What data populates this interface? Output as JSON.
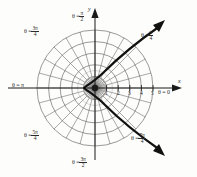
{
  "figure": {
    "background_color": "#fdfdfc",
    "grid_color": "#6f6f6f",
    "axis_color": "#1a1a1a",
    "curve_color": "#111111",
    "pole": {
      "x": 95,
      "y": 88
    },
    "unit_px": 11.6,
    "axes": {
      "x_label": "x",
      "y_label": "y"
    },
    "radial_ticks": [
      "1",
      "2",
      "3",
      "4",
      "5"
    ],
    "radial_circle_count": 5,
    "spoke_count": 24,
    "angle_labels": [
      {
        "key": "theta_pi_over_2",
        "theta": "θ =",
        "num": "π",
        "den": "2",
        "deg": 90
      },
      {
        "key": "theta_3pi_over_4",
        "theta": "θ =",
        "num": "3π",
        "den": "4",
        "deg": 135
      },
      {
        "key": "theta_pi",
        "theta": "θ =",
        "num": "π",
        "den": "",
        "deg": 180
      },
      {
        "key": "theta_5pi_over_4",
        "theta": "θ =",
        "num": "5π",
        "den": "4",
        "deg": 225
      },
      {
        "key": "theta_3pi_over_2",
        "theta": "θ =",
        "num": "3π",
        "den": "2",
        "deg": 270
      },
      {
        "key": "theta_7pi_over_4",
        "theta": "θ =",
        "num": "7π",
        "den": "4",
        "deg": 315
      },
      {
        "key": "theta_0",
        "theta": "θ =",
        "num": "0",
        "den": "",
        "deg": 0
      },
      {
        "key": "theta_pi_over_4",
        "theta": "θ =",
        "num": "π",
        "den": "4",
        "deg": 45
      }
    ],
    "curve": {
      "type": "polar-conic",
      "description": "curve opening to the left, vertex near r=1 on the theta=pi ray, branches sweeping out through theta=pi/4 and theta=7pi/4 with arrowheads",
      "vertex": {
        "x": 84,
        "y": 88
      },
      "arrow_upper_tip": {
        "x": 164,
        "y": 21
      },
      "arrow_lower_tip": {
        "x": 164,
        "y": 153
      }
    }
  }
}
